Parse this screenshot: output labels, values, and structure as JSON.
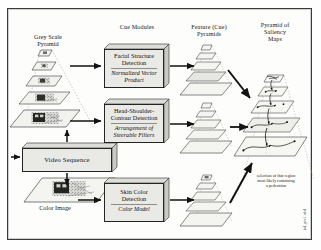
{
  "figure": {
    "type": "block-diagram"
  },
  "headings": {
    "cue_modules": "Cue Modules",
    "feature_pyramids": "Feature (Cue)\nPyramids",
    "saliency_pyramid": "Pyramid of\nSaliency\nMaps"
  },
  "inputs": {
    "grey_pyramid_label": "Grey Scale\nPyramid",
    "video_sequence_label": "Video Sequence",
    "color_image_label": "Color Image"
  },
  "cue_modules": [
    {
      "id": "facial-structure",
      "title": "Facial Structure\nDetection",
      "method": "Normalized Vector\nProduct"
    },
    {
      "id": "head-shoulder",
      "title": "Head-Shoulder-\nContour Detection",
      "method": "Arrangement of\nSteerable Filters"
    },
    {
      "id": "skin-color",
      "title": "Skin Color\nDetection",
      "method": "Color Model"
    }
  ],
  "caption": "selection of that region\nmost likely containing\na pedestrian",
  "sidecode": "ial_prv1.cdsl",
  "colors": {
    "ink": "#161616",
    "box_fill": "#e9e9e6",
    "plane_fill": "#f4f4f1",
    "frame": "#3a3a3a"
  }
}
